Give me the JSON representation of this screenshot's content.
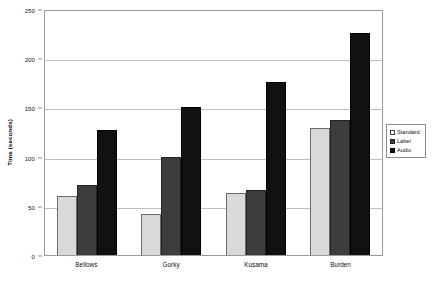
{
  "chart_data": {
    "type": "bar",
    "title": "",
    "xlabel": "",
    "ylabel": "Time (seconds)",
    "categories": [
      "Bellows",
      "Gorky",
      "Kusama",
      "Burden"
    ],
    "series": [
      {
        "name": "Standard",
        "color": "#d9d9d9",
        "values": [
          60,
          42,
          63,
          129
        ]
      },
      {
        "name": "Label",
        "color": "#3d3d3d",
        "values": [
          71,
          100,
          66,
          137
        ]
      },
      {
        "name": "Audio",
        "color": "#111111",
        "values": [
          127,
          150,
          176,
          226
        ]
      }
    ],
    "ylim": [
      0,
      250
    ],
    "yticks": [
      0,
      50,
      100,
      150,
      200,
      250
    ],
    "ytick_labels": [
      "0",
      "50",
      "100",
      "150",
      "200",
      "250"
    ],
    "grid": true,
    "grid_axis": "y",
    "legend_position": "right-outside",
    "legend_entries": [
      "Standard",
      "Label",
      "Audio"
    ]
  }
}
